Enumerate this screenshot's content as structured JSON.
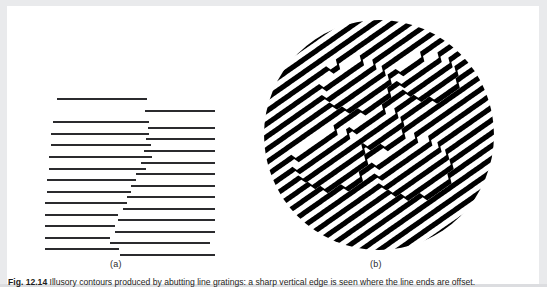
{
  "page": {
    "background": "#ffffff",
    "edge_shade": "#e9eaec",
    "ink": "#2b2b2e"
  },
  "figure": {
    "panels": [
      {
        "id": "a",
        "label": "(a)",
        "name": "abutting-line-grating"
      },
      {
        "id": "b",
        "label": "(b)",
        "name": "circular-diagonal-grating"
      }
    ],
    "caption_number": "Fig. 12.14",
    "caption_text": "Illusory contours produced by abutting line gratings: a sharp vertical edge is seen where the line ends are offset.",
    "caption_clipped": true
  },
  "panel_a": {
    "name": "abutting-line-grating",
    "description": "Two interleaved columns of horizontal line segments whose abutting ends form an illusory vertical contour.",
    "line_color": "#2b2b2e",
    "line_thickness_px": 2,
    "row_spacing_px": 11.6,
    "row_count": 13,
    "left_lines": [
      {
        "row": 0,
        "x": 12,
        "y": 0,
        "width": 90
      },
      {
        "row": 1,
        "x": 8,
        "y": 23,
        "width": 96
      },
      {
        "row": 2,
        "x": 6,
        "y": 35,
        "width": 98
      },
      {
        "row": 3,
        "x": 6,
        "y": 46,
        "width": 100
      },
      {
        "row": 4,
        "x": 4,
        "y": 58,
        "width": 103
      },
      {
        "row": 5,
        "x": 4,
        "y": 70,
        "width": 97
      },
      {
        "row": 6,
        "x": 2,
        "y": 81,
        "width": 89
      },
      {
        "row": 7,
        "x": 2,
        "y": 93,
        "width": 84
      },
      {
        "row": 8,
        "x": 0,
        "y": 104,
        "width": 82
      },
      {
        "row": 9,
        "x": 0,
        "y": 116,
        "width": 73
      },
      {
        "row": 10,
        "x": 0,
        "y": 127,
        "width": 70
      },
      {
        "row": 11,
        "x": 0,
        "y": 139,
        "width": 65
      },
      {
        "row": 12,
        "x": 0,
        "y": 150,
        "width": 74
      }
    ],
    "right_lines": [
      {
        "row": 0,
        "x": 100,
        "y": 12,
        "width": 70
      },
      {
        "row": 1,
        "x": 103,
        "y": 29,
        "width": 67
      },
      {
        "row": 2,
        "x": 101,
        "y": 40,
        "width": 69
      },
      {
        "row": 3,
        "x": 99,
        "y": 52,
        "width": 71
      },
      {
        "row": 4,
        "x": 96,
        "y": 64,
        "width": 74
      },
      {
        "row": 5,
        "x": 91,
        "y": 75,
        "width": 79
      },
      {
        "row": 6,
        "x": 86,
        "y": 87,
        "width": 84
      },
      {
        "row": 7,
        "x": 82,
        "y": 98,
        "width": 88
      },
      {
        "row": 8,
        "x": 78,
        "y": 110,
        "width": 92
      },
      {
        "row": 9,
        "x": 73,
        "y": 121,
        "width": 97
      },
      {
        "row": 10,
        "x": 70,
        "y": 133,
        "width": 100
      },
      {
        "row": 11,
        "x": 65,
        "y": 144,
        "width": 100
      },
      {
        "row": 12,
        "x": 75,
        "y": 156,
        "width": 95
      }
    ]
  },
  "panel_b": {
    "name": "circular-diagonal-grating",
    "description": "Circular field of diagonal black stripes tilted about 35 degrees; local phase shifts of the stripes generate illusory contours of shapes inside the disc.",
    "stripe_color": "#000000",
    "background_color": "#ffffff",
    "circle": {
      "cx": 122,
      "cy": 129,
      "r": 115
    },
    "stripe_angle_deg": -35,
    "stripe_period_px": 10.5,
    "stripe_width_px": 5.2,
    "stripe_count": 42,
    "shift_regions": [
      {
        "shape": "blob",
        "cx": 98,
        "cy": 78,
        "rx": 34,
        "ry": 26,
        "phase_shift_px": 5.2
      },
      {
        "shape": "blob",
        "cx": 170,
        "cy": 70,
        "rx": 30,
        "ry": 22,
        "phase_shift_px": 5.2
      },
      {
        "shape": "blob",
        "cx": 72,
        "cy": 152,
        "rx": 36,
        "ry": 30,
        "phase_shift_px": 5.2
      },
      {
        "shape": "blob",
        "cx": 155,
        "cy": 160,
        "rx": 38,
        "ry": 30,
        "phase_shift_px": 5.2
      },
      {
        "shape": "blob",
        "cx": 120,
        "cy": 120,
        "rx": 26,
        "ry": 20,
        "phase_shift_px": 5.2
      }
    ]
  },
  "chart_data": {
    "type": "diagram",
    "panels": [
      {
        "label": "(a)",
        "kind": "abutting-line-grating",
        "rows": 13,
        "notes": "Left and right horizontal line segments abut along a vertical midline; the staircase of offset endpoints induces an illusory vertical edge."
      },
      {
        "label": "(b)",
        "kind": "circular-diagonal-grating",
        "stripe_angle_deg": -35,
        "stripes": 42,
        "notes": "Diagonal grating inside a disc; abrupt half-period phase shifts along closed paths create illusory contours of enclosed shapes."
      }
    ]
  }
}
